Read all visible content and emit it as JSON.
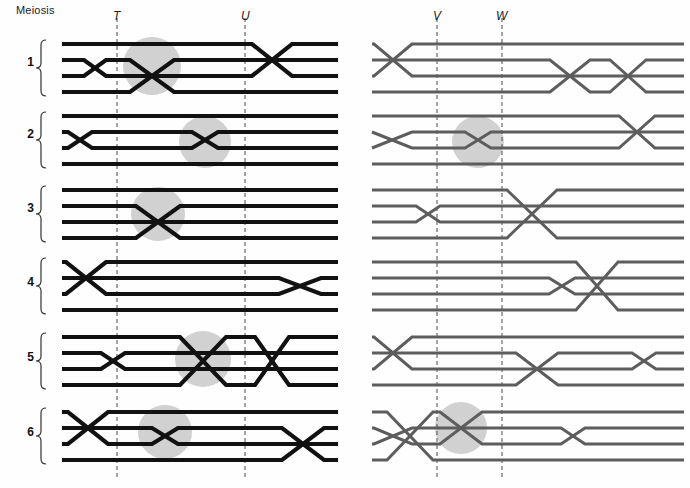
{
  "figure": {
    "title_label": "Meiosis",
    "width": 690,
    "height": 488,
    "colors": {
      "left_chromatid": "#111111",
      "right_chromatid": "#5d5d5d",
      "highlight_circle": "#c9c9c9",
      "marker_line": "#4a4a4a",
      "brace": "#333333",
      "background": "#fefefe",
      "text": "#1a1a1a"
    },
    "line_widths": {
      "left_panel": 4.2,
      "right_panel": 3.0
    },
    "geometry": {
      "row_tops": [
        40,
        110,
        180,
        255,
        330,
        405
      ],
      "strand_gap": 16,
      "left_panel": {
        "x_start": 62,
        "x_end": 338
      },
      "right_panel": {
        "x_start": 372,
        "x_end": 684
      }
    }
  },
  "markers": {
    "left": [
      {
        "name": "T",
        "label": "T",
        "x": 117,
        "label_x": 113,
        "label_y": 9
      },
      {
        "name": "U",
        "label": "U",
        "x": 245,
        "label_x": 241,
        "label_y": 9
      }
    ],
    "right": [
      {
        "name": "V",
        "label": "V",
        "x": 437,
        "label_x": 433,
        "label_y": 9
      },
      {
        "name": "W",
        "label": "W",
        "x": 502,
        "label_x": 496,
        "label_y": 9
      }
    ],
    "line_top": 18,
    "line_bottom": 478,
    "dash_pattern": "4,3"
  },
  "rows": [
    {
      "number": "1",
      "label": "1",
      "brace_top": 40,
      "brace_bottom": 96,
      "label_y": 62,
      "left": {
        "crossovers": [
          {
            "x": 95,
            "strands": [
              1,
              2
            ],
            "width": 22,
            "highlighted": false
          },
          {
            "x": 152,
            "strands": [
              1,
              3
            ],
            "width": 44,
            "highlighted": true
          },
          {
            "x": 272,
            "strands": [
              0,
              2
            ],
            "width": 40,
            "highlighted": false
          }
        ],
        "highlight": {
          "cx": 152,
          "cy": 66,
          "r": 29
        }
      },
      "right": {
        "crossovers": [
          {
            "x": 393,
            "strands": [
              0,
              2
            ],
            "width": 38,
            "highlighted": false
          },
          {
            "x": 570,
            "strands": [
              1,
              3
            ],
            "width": 40,
            "highlighted": false
          },
          {
            "x": 628,
            "strands": [
              1,
              3
            ],
            "width": 36,
            "highlighted": false
          }
        ],
        "highlight": null
      }
    },
    {
      "number": "2",
      "label": "2",
      "brace_top": 112,
      "brace_bottom": 168,
      "label_y": 134,
      "left": {
        "crossovers": [
          {
            "x": 80,
            "strands": [
              1,
              2
            ],
            "width": 24,
            "highlighted": false
          },
          {
            "x": 205,
            "strands": [
              1,
              2
            ],
            "width": 26,
            "highlighted": true
          }
        ],
        "highlight": {
          "cx": 205,
          "cy": 142,
          "r": 26
        }
      },
      "right": {
        "crossovers": [
          {
            "x": 392,
            "strands": [
              1,
              2
            ],
            "width": 40,
            "highlighted": false
          },
          {
            "x": 478,
            "strands": [
              1,
              2
            ],
            "width": 26,
            "highlighted": true
          },
          {
            "x": 637,
            "strands": [
              0,
              2
            ],
            "width": 36,
            "highlighted": false
          }
        ],
        "highlight": {
          "cx": 478,
          "cy": 142,
          "r": 26
        }
      }
    },
    {
      "number": "3",
      "label": "3",
      "brace_top": 186,
      "brace_bottom": 242,
      "label_y": 208,
      "left": {
        "crossovers": [
          {
            "x": 158,
            "strands": [
              1,
              3
            ],
            "width": 44,
            "highlighted": true
          }
        ],
        "highlight": {
          "cx": 158,
          "cy": 214,
          "r": 27
        }
      },
      "right": {
        "crossovers": [
          {
            "x": 428,
            "strands": [
              1,
              2
            ],
            "width": 24,
            "highlighted": false
          },
          {
            "x": 532,
            "strands": [
              0,
              3
            ],
            "width": 50,
            "highlighted": false
          }
        ],
        "highlight": null
      }
    },
    {
      "number": "4",
      "label": "4",
      "brace_top": 258,
      "brace_bottom": 314,
      "label_y": 282,
      "left": {
        "crossovers": [
          {
            "x": 86,
            "strands": [
              0,
              2
            ],
            "width": 40,
            "highlighted": false
          },
          {
            "x": 300,
            "strands": [
              1,
              2
            ],
            "width": 42,
            "highlighted": false
          }
        ],
        "highlight": null
      },
      "right": {
        "crossovers": [
          {
            "x": 562,
            "strands": [
              1,
              2
            ],
            "width": 26,
            "highlighted": false
          },
          {
            "x": 597,
            "strands": [
              0,
              3
            ],
            "width": 42,
            "highlighted": false
          }
        ],
        "highlight": null
      }
    },
    {
      "number": "5",
      "label": "5",
      "brace_top": 333,
      "brace_bottom": 389,
      "label_y": 357,
      "left": {
        "crossovers": [
          {
            "x": 113,
            "strands": [
              1,
              2
            ],
            "width": 24,
            "highlighted": false
          },
          {
            "x": 203,
            "strands": [
              0,
              3
            ],
            "width": 46,
            "highlighted": true
          },
          {
            "x": 272,
            "strands": [
              0,
              3
            ],
            "width": 34,
            "highlighted": false
          }
        ],
        "highlight": {
          "cx": 203,
          "cy": 359,
          "r": 28
        }
      },
      "right": {
        "crossovers": [
          {
            "x": 393,
            "strands": [
              0,
              2
            ],
            "width": 38,
            "highlighted": false
          },
          {
            "x": 537,
            "strands": [
              1,
              3
            ],
            "width": 42,
            "highlighted": false
          },
          {
            "x": 644,
            "strands": [
              1,
              2
            ],
            "width": 24,
            "highlighted": false
          }
        ],
        "highlight": null
      }
    },
    {
      "number": "6",
      "label": "6",
      "brace_top": 408,
      "brace_bottom": 464,
      "label_y": 432,
      "left": {
        "crossovers": [
          {
            "x": 88,
            "strands": [
              0,
              2
            ],
            "width": 40,
            "highlighted": false
          },
          {
            "x": 165,
            "strands": [
              1,
              2
            ],
            "width": 26,
            "highlighted": true
          },
          {
            "x": 303,
            "strands": [
              1,
              3
            ],
            "width": 42,
            "highlighted": false
          }
        ],
        "highlight": {
          "cx": 165,
          "cy": 432,
          "r": 27
        }
      },
      "right": {
        "crossovers": [
          {
            "x": 393,
            "strands": [
              1,
              2
            ],
            "width": 38,
            "highlighted": false
          },
          {
            "x": 410,
            "strands": [
              0,
              3
            ],
            "width": 46,
            "highlighted": false
          },
          {
            "x": 461,
            "strands": [
              0,
              2
            ],
            "width": 42,
            "highlighted": true
          },
          {
            "x": 573,
            "strands": [
              1,
              2
            ],
            "width": 24,
            "highlighted": false
          }
        ],
        "highlight": {
          "cx": 461,
          "cy": 428,
          "r": 26
        }
      }
    }
  ]
}
